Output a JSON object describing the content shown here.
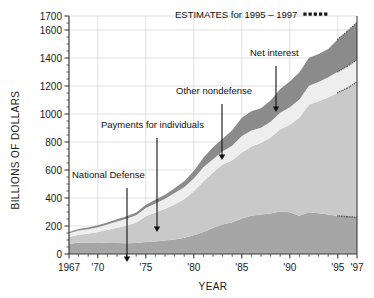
{
  "chart_data": {
    "type": "area",
    "title": "",
    "xlabel": "YEAR",
    "ylabel": "BILLIONS OF DOLLARS",
    "xlim": [
      1967,
      1997
    ],
    "ylim": [
      0,
      1700
    ],
    "grid": true,
    "legend_position": "annotations-inline",
    "y_ticks": [
      0,
      200,
      400,
      600,
      800,
      1000,
      1200,
      1400,
      1600,
      1700
    ],
    "y_tick_labels": [
      "0",
      "200",
      "400",
      "600",
      "800",
      "1000",
      "1200",
      "1400",
      "1600",
      "1700"
    ],
    "y_minor_step": 50,
    "x_ticks": [
      1967,
      1970,
      1975,
      1980,
      1985,
      1990,
      1995,
      1997
    ],
    "x_tick_labels": [
      "1967",
      "'70",
      "'75",
      "'80",
      "'85",
      "'90",
      "'95",
      "'97"
    ],
    "x_minor_step": 1,
    "estimates_note": "ESTIMATES for 1995 – 1997",
    "estimates_start_year": 1995,
    "stack_order_bottom_to_top": [
      "National Defense",
      "Payments for individuals",
      "Other nondefense",
      "Net interest"
    ],
    "x": [
      1967,
      1968,
      1969,
      1970,
      1971,
      1972,
      1973,
      1974,
      1975,
      1976,
      1977,
      1978,
      1979,
      1980,
      1981,
      1982,
      1983,
      1984,
      1985,
      1986,
      1987,
      1988,
      1989,
      1990,
      1991,
      1992,
      1993,
      1994,
      1995,
      1996,
      1997
    ],
    "series": [
      {
        "name": "National Defense",
        "color": "#a6a6a6",
        "values": [
          72,
          82,
          82,
          82,
          79,
          79,
          77,
          79,
          86,
          90,
          97,
          104,
          116,
          134,
          158,
          185,
          210,
          227,
          253,
          273,
          282,
          290,
          304,
          299,
          273,
          298,
          291,
          282,
          272,
          266,
          262
        ]
      },
      {
        "name": "Payments for individuals",
        "color": "#c9c9c9",
        "values": [
          49,
          55,
          62,
          75,
          92,
          108,
          125,
          146,
          184,
          207,
          227,
          249,
          275,
          314,
          360,
          398,
          430,
          442,
          470,
          495,
          510,
          542,
          585,
          625,
          700,
          770,
          800,
          835,
          880,
          920,
          965
        ]
      },
      {
        "name": "Other nondefense",
        "color": "#eeeeee",
        "values": [
          27,
          30,
          33,
          34,
          39,
          46,
          50,
          51,
          58,
          63,
          70,
          82,
          86,
          92,
          101,
          94,
          94,
          104,
          120,
          115,
          110,
          113,
          120,
          125,
          130,
          133,
          138,
          145,
          150,
          155,
          160
        ]
      },
      {
        "name": "Net interest",
        "color": "#8b8b8b",
        "values": [
          10,
          11,
          12,
          14,
          15,
          15,
          17,
          21,
          23,
          27,
          30,
          35,
          43,
          53,
          69,
          85,
          90,
          111,
          130,
          136,
          139,
          152,
          169,
          184,
          195,
          200,
          199,
          203,
          232,
          250,
          268
        ]
      }
    ],
    "annotations": [
      {
        "label": "National Defense",
        "text_x": 72,
        "text_y": 178,
        "arrow_x": 127,
        "arrow_y1": 188,
        "arrow_y2": 262
      },
      {
        "label": "Payments for individuals",
        "text_x": 101,
        "text_y": 128,
        "arrow_x": 157,
        "arrow_y1": 138,
        "arrow_y2": 232
      },
      {
        "label": "Other nondefense",
        "text_x": 176,
        "text_y": 94,
        "arrow_x": 222,
        "arrow_y1": 104,
        "arrow_y2": 160
      },
      {
        "label": "Net interest",
        "text_x": 250,
        "text_y": 56,
        "arrow_x": 276,
        "arrow_y1": 66,
        "arrow_y2": 112
      }
    ]
  },
  "colors": {
    "background": "#ffffff",
    "axis": "#3d3d3d",
    "grid": "#d7d7d7",
    "text": "#111111",
    "national_defense": "#a6a6a6",
    "payments_for_individuals": "#c9c9c9",
    "other_nondefense": "#eeeeee",
    "net_interest": "#8b8b8b"
  }
}
